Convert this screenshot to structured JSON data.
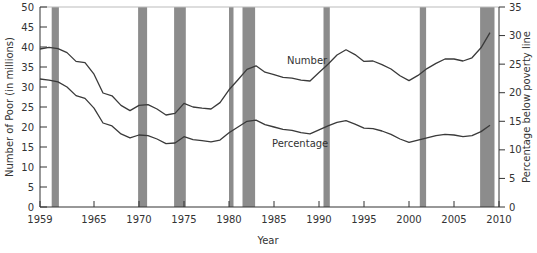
{
  "chart_data": {
    "type": "line",
    "title": "",
    "xlabel": "Year",
    "ylabel_left": "Number of Poor (in millions)",
    "ylabel_right": "Percentage below poverty line",
    "xlim": [
      1959,
      2010
    ],
    "ylim_left": [
      0,
      50
    ],
    "ylim_right": [
      0,
      35
    ],
    "x_ticks": [
      "1959",
      "1965",
      "1970",
      "1975",
      "1980",
      "1985",
      "1990",
      "1995",
      "2000",
      "2005",
      "2010"
    ],
    "y_ticks_left": [
      "0",
      "5",
      "10",
      "15",
      "20",
      "25",
      "30",
      "35",
      "40",
      "45",
      "50"
    ],
    "y_ticks_right": [
      "0",
      "5",
      "10",
      "15",
      "20",
      "25",
      "30",
      "35"
    ],
    "grid": false,
    "legend": "inline labels",
    "recession_bands": [
      [
        1960.3,
        1961.1
      ],
      [
        1969.9,
        1970.9
      ],
      [
        1973.9,
        1975.2
      ],
      [
        1980.0,
        1980.5
      ],
      [
        1981.5,
        1982.9
      ],
      [
        1990.5,
        1991.2
      ],
      [
        2001.2,
        2001.9
      ],
      [
        2007.9,
        2009.5
      ]
    ],
    "x": [
      1959,
      1960,
      1961,
      1962,
      1963,
      1964,
      1965,
      1966,
      1967,
      1968,
      1969,
      1970,
      1971,
      1972,
      1973,
      1974,
      1975,
      1976,
      1977,
      1978,
      1979,
      1980,
      1981,
      1982,
      1983,
      1984,
      1985,
      1986,
      1987,
      1988,
      1989,
      1990,
      1991,
      1992,
      1993,
      1994,
      1995,
      1996,
      1997,
      1998,
      1999,
      2000,
      2001,
      2002,
      2003,
      2004,
      2005,
      2006,
      2007,
      2008,
      2009
    ],
    "series": [
      {
        "name": "Number",
        "axis": "left",
        "unit": "millions",
        "values": [
          39.5,
          39.9,
          39.6,
          38.6,
          36.4,
          36.1,
          33.2,
          28.5,
          27.8,
          25.4,
          24.1,
          25.4,
          25.6,
          24.5,
          23.0,
          23.4,
          25.9,
          25.0,
          24.7,
          24.5,
          26.1,
          29.3,
          31.8,
          34.4,
          35.3,
          33.7,
          33.1,
          32.4,
          32.2,
          31.7,
          31.5,
          33.6,
          35.7,
          38.0,
          39.3,
          38.1,
          36.4,
          36.5,
          35.6,
          34.5,
          32.8,
          31.6,
          32.9,
          34.6,
          35.9,
          37.0,
          37.0,
          36.5,
          37.3,
          39.8,
          43.6
        ]
      },
      {
        "name": "Percentage",
        "axis": "right",
        "unit": "percent",
        "values": [
          22.4,
          22.2,
          21.9,
          21.0,
          19.5,
          19.0,
          17.3,
          14.7,
          14.2,
          12.8,
          12.1,
          12.6,
          12.5,
          11.9,
          11.1,
          11.2,
          12.3,
          11.8,
          11.6,
          11.4,
          11.7,
          13.0,
          14.0,
          15.0,
          15.2,
          14.4,
          14.0,
          13.6,
          13.4,
          13.0,
          12.8,
          13.5,
          14.2,
          14.8,
          15.1,
          14.5,
          13.8,
          13.7,
          13.3,
          12.7,
          11.9,
          11.3,
          11.7,
          12.1,
          12.5,
          12.7,
          12.6,
          12.3,
          12.5,
          13.2,
          14.3
        ]
      }
    ]
  },
  "labels": {
    "series_number": "Number",
    "series_percentage": "Percentage",
    "xlabel": "Year",
    "ylabel_left": "Number of Poor (in millions)",
    "ylabel_right": "Percentage below poverty line"
  },
  "colors": {
    "line": "#3a3a3a",
    "recession_band": "#8c8c8c",
    "axis": "#333333"
  }
}
